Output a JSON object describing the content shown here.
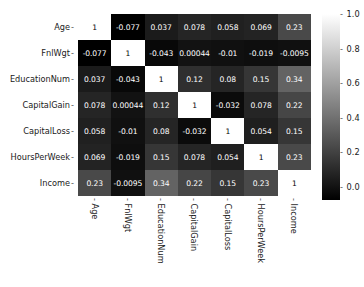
{
  "chart_data": {
    "type": "heatmap",
    "title": "",
    "xlabel": "",
    "ylabel": "",
    "grid": false,
    "legend_position": "right",
    "colormap": "gray",
    "categories": [
      "Age",
      "FnlWgt",
      "EducationNum",
      "CapitalGain",
      "CapitalLoss",
      "HoursPerWeek",
      "Income"
    ],
    "x_tick_labels": [
      "Age",
      "FnlWgt",
      "EducationNum",
      "CapitalGain",
      "CapitalLoss",
      "HoursPerWeek",
      "Income"
    ],
    "y_tick_labels": [
      "Age",
      "FnlWgt",
      "EducationNum",
      "CapitalGain",
      "CapitalLoss",
      "HoursPerWeek",
      "Income"
    ],
    "values": [
      [
        1,
        -0.077,
        0.037,
        0.078,
        0.058,
        0.069,
        0.23
      ],
      [
        -0.077,
        1,
        -0.043,
        0.00044,
        -0.01,
        -0.019,
        -0.0095
      ],
      [
        0.037,
        -0.043,
        1,
        0.12,
        0.08,
        0.15,
        0.34
      ],
      [
        0.078,
        0.00044,
        0.12,
        1,
        -0.032,
        0.078,
        0.22
      ],
      [
        0.058,
        -0.01,
        0.08,
        -0.032,
        1,
        0.054,
        0.15
      ],
      [
        0.069,
        -0.019,
        0.15,
        0.078,
        0.054,
        1,
        0.23
      ],
      [
        0.23,
        -0.0095,
        0.34,
        0.22,
        0.15,
        0.23,
        1
      ]
    ],
    "annotations": [
      [
        "1",
        "-0.077",
        "0.037",
        "0.078",
        "0.058",
        "0.069",
        "0.23"
      ],
      [
        "-0.077",
        "1",
        "-0.043",
        "0.00044",
        "-0.01",
        "-0.019",
        "-0.0095"
      ],
      [
        "0.037",
        "-0.043",
        "1",
        "0.12",
        "0.08",
        "0.15",
        "0.34"
      ],
      [
        "0.078",
        "0.00044",
        "0.12",
        "1",
        "-0.032",
        "0.078",
        "0.22"
      ],
      [
        "0.058",
        "-0.01",
        "0.08",
        "-0.032",
        "1",
        "0.054",
        "0.15"
      ],
      [
        "0.069",
        "-0.019",
        "0.15",
        "0.078",
        "0.054",
        "1",
        "0.23"
      ],
      [
        "0.23",
        "-0.0095",
        "0.34",
        "0.22",
        "0.15",
        "0.23",
        "1"
      ]
    ],
    "colorbar": {
      "ticks": [
        "1.0",
        "0.8",
        "0.6",
        "0.4",
        "0.2",
        "0.0"
      ],
      "tick_values": [
        1.0,
        0.8,
        0.6,
        0.4,
        0.2,
        0.0
      ],
      "vmin": -0.077,
      "vmax": 1.0,
      "top_color": "#ffffff",
      "bottom_color": "#000000"
    }
  }
}
